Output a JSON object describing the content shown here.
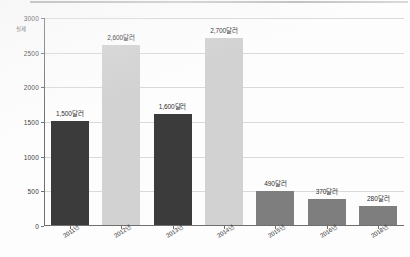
{
  "chart_data": {
    "type": "bar",
    "title": "",
    "subtitle": "",
    "xlabel": "",
    "ylabel": "",
    "unit_label": "실제",
    "ylim": [
      0,
      3000
    ],
    "ytick_values": [
      0,
      500,
      1000,
      1500,
      2000,
      2500,
      3000
    ],
    "ytick_labels": [
      "0",
      "500",
      "1000",
      "1500",
      "2000",
      "2500",
      "3000"
    ],
    "grid": true,
    "grid_orientation": "horizontal",
    "legend": "none",
    "categories": [
      "2011년",
      "2012년",
      "2013년",
      "2014년",
      "2015년",
      "2016년",
      "2018년"
    ],
    "values": [
      1500,
      2600,
      1600,
      2700,
      490,
      370,
      280
    ],
    "data_labels": [
      "1,500달러",
      "2,600달러",
      "1,600달러",
      "2,700달러",
      "490달러",
      "370달러",
      "280달러"
    ],
    "series": [
      {
        "name": "",
        "values": [
          1500,
          2600,
          1600,
          2700,
          490,
          370,
          280
        ]
      }
    ],
    "bar_styles": [
      "dark",
      "light",
      "dark",
      "light",
      "mid",
      "mid",
      "mid"
    ],
    "colors": {
      "dark": "#3b3b3b",
      "light": "#d2d2d2",
      "mid": "#7e7e7e",
      "axis": "#6f6f6f",
      "grid": "#d9d9d9",
      "text": "#2e2e2e",
      "background": "#fdfdfd"
    }
  }
}
